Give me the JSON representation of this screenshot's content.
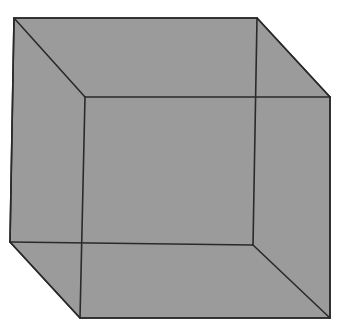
{
  "figure": {
    "colors": {
      "background": "#ffffff",
      "fill": "#9b9b9b",
      "edge": "#2a2a2a"
    },
    "vertices": {
      "back_top_left": [
        14,
        18
      ],
      "back_top_right": [
        257,
        18
      ],
      "back_bottom_right": [
        253,
        245
      ],
      "back_bottom_left": [
        10,
        242
      ],
      "front_top_left": [
        85,
        97
      ],
      "front_top_right": [
        330,
        97
      ],
      "front_bottom_right": [
        330,
        318
      ],
      "front_bottom_left": [
        80,
        318
      ]
    }
  }
}
